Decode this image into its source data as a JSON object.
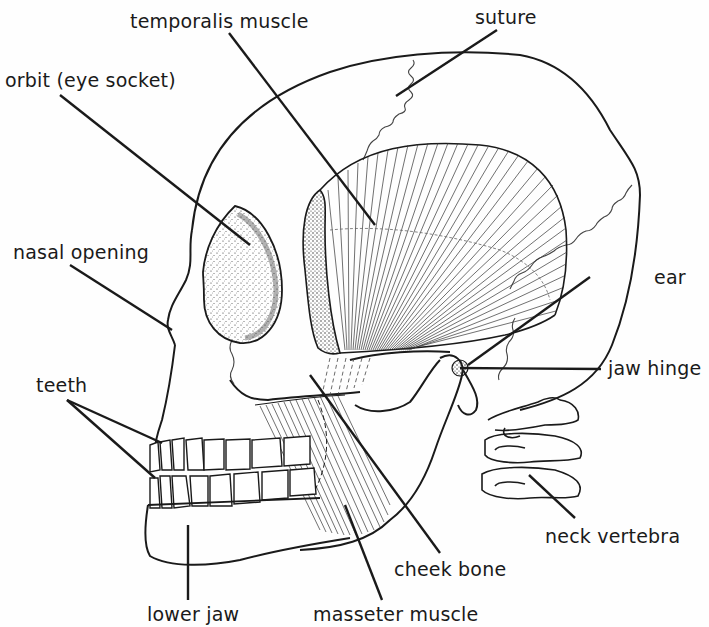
{
  "diagram": {
    "colors": {
      "ink": "#1a1a1a",
      "background": "#fefefe"
    },
    "labels": {
      "temporalis_muscle": "temporalis muscle",
      "suture": "suture",
      "orbit": "orbit (eye socket)",
      "nasal_opening": "nasal opening",
      "ear": "ear",
      "jaw_hinge": "jaw hinge",
      "teeth": "teeth",
      "neck_vertebra": "neck vertebra",
      "cheek_bone": "cheek bone",
      "lower_jaw": "lower jaw",
      "masseter_muscle": "masseter muscle"
    }
  }
}
